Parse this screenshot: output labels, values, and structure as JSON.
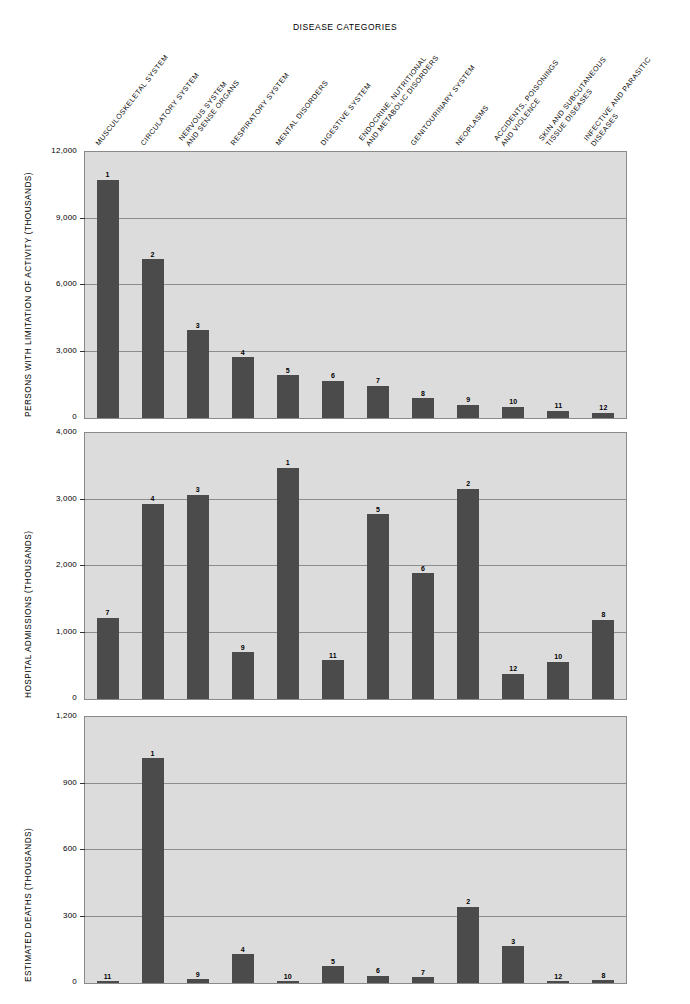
{
  "chart_title": "DISEASE CATEGORIES",
  "categories": [
    {
      "id": 1,
      "lines": [
        "MUSCULOSKELETAL SYSTEM"
      ]
    },
    {
      "id": 2,
      "lines": [
        "CIRCULATORY SYSTEM"
      ]
    },
    {
      "id": 3,
      "lines": [
        "NERVOUS SYSTEM",
        "AND SENSE ORGANS"
      ]
    },
    {
      "id": 4,
      "lines": [
        "RESPIRATORY SYSTEM"
      ]
    },
    {
      "id": 5,
      "lines": [
        "MENTAL DISORDERS"
      ]
    },
    {
      "id": 6,
      "lines": [
        "DIGESTIVE SYSTEM"
      ]
    },
    {
      "id": 7,
      "lines": [
        "ENDOCRINE, NUTRITIONAL",
        "AND METABOLIC DISORDERS"
      ]
    },
    {
      "id": 8,
      "lines": [
        "GENITOURINARY SYSTEM"
      ]
    },
    {
      "id": 9,
      "lines": [
        "NEOPLASMS"
      ]
    },
    {
      "id": 10,
      "lines": [
        "ACCIDENTS, POISONINGS",
        "AND VIOLENCE"
      ]
    },
    {
      "id": 11,
      "lines": [
        "SKIN AND SUBCUTANEOUS",
        "TISSUE DISEASES"
      ]
    },
    {
      "id": 12,
      "lines": [
        "INFECTIVE AND PARASITIC",
        "DISEASES"
      ]
    }
  ],
  "chart_data": [
    {
      "type": "bar",
      "title": "",
      "ylabel": "PERSONS WITH LIMITATION OF ACTIVITY (THOUSANDS)",
      "xlabel": "DISEASE CATEGORIES",
      "ylim": [
        0,
        12000
      ],
      "yticks": [
        0,
        3000,
        6000,
        9000,
        12000
      ],
      "ytick_labels": [
        "0",
        "3,000",
        "6,000",
        "9,000",
        "12,000"
      ],
      "grid": true,
      "legend": "none",
      "categories": [
        "MUSCULOSKELETAL SYSTEM",
        "CIRCULATORY SYSTEM",
        "NERVOUS SYSTEM AND SENSE ORGANS",
        "RESPIRATORY SYSTEM",
        "MENTAL DISORDERS",
        "DIGESTIVE SYSTEM",
        "ENDOCRINE, NUTRITIONAL AND METABOLIC DISORDERS",
        "GENITOURINARY SYSTEM",
        "NEOPLASMS",
        "ACCIDENTS, POISONINGS AND VIOLENCE",
        "SKIN AND SUBCUTANEOUS TISSUE DISEASES",
        "INFECTIVE AND PARASITIC DISEASES"
      ],
      "values": [
        10760,
        7170,
        3970,
        2750,
        1940,
        1670,
        1450,
        900,
        590,
        500,
        320,
        230
      ],
      "rank_labels": [
        "1",
        "2",
        "3",
        "4",
        "5",
        "6",
        "7",
        "8",
        "9",
        "10",
        "11",
        "12"
      ]
    },
    {
      "type": "bar",
      "title": "",
      "ylabel": "HOSPITAL ADMISSIONS (THOUSANDS)",
      "xlabel": "DISEASE CATEGORIES",
      "ylim": [
        0,
        4000
      ],
      "yticks": [
        0,
        1000,
        2000,
        3000,
        4000
      ],
      "ytick_labels": [
        "0",
        "1,000",
        "2,000",
        "3,000",
        "4,000"
      ],
      "grid": true,
      "legend": "none",
      "categories": [
        "MUSCULOSKELETAL SYSTEM",
        "CIRCULATORY SYSTEM",
        "NERVOUS SYSTEM AND SENSE ORGANS",
        "RESPIRATORY SYSTEM",
        "MENTAL DISORDERS",
        "DIGESTIVE SYSTEM",
        "ENDOCRINE, NUTRITIONAL AND METABOLIC DISORDERS",
        "GENITOURINARY SYSTEM",
        "NEOPLASMS",
        "ACCIDENTS, POISONINGS AND VIOLENCE",
        "SKIN AND SUBCUTANEOUS TISSUE DISEASES",
        "INFECTIVE AND PARASITIC DISEASES"
      ],
      "values": [
        1220,
        2940,
        3075,
        700,
        3480,
        580,
        2780,
        1890,
        3165,
        380,
        560,
        1190
      ],
      "rank_labels": [
        "7",
        "4",
        "3",
        "9",
        "1",
        "11",
        "5",
        "6",
        "2",
        "12",
        "10",
        "8"
      ]
    },
    {
      "type": "bar",
      "title": "",
      "ylabel": "ESTIMATED DEATHS (THOUSANDS)",
      "xlabel": "DISEASE CATEGORIES",
      "ylim": [
        0,
        1200
      ],
      "yticks": [
        0,
        300,
        600,
        900,
        1200
      ],
      "ytick_labels": [
        "0",
        "300",
        "600",
        "900",
        "1,200"
      ],
      "grid": true,
      "legend": "none",
      "categories": [
        "MUSCULOSKELETAL SYSTEM",
        "CIRCULATORY SYSTEM",
        "NERVOUS SYSTEM AND SENSE ORGANS",
        "RESPIRATORY SYSTEM",
        "MENTAL DISORDERS",
        "DIGESTIVE SYSTEM",
        "ENDOCRINE, NUTRITIONAL AND METABOLIC DISORDERS",
        "GENITOURINARY SYSTEM",
        "NEOPLASMS",
        "ACCIDENTS, POISONINGS AND VIOLENCE",
        "SKIN AND SUBCUTANEOUS TISSUE DISEASES",
        "INFECTIVE AND PARASITIC DISEASES"
      ],
      "values": [
        6,
        1015,
        16,
        130,
        9,
        75,
        32,
        25,
        345,
        165,
        4,
        13
      ],
      "rank_labels": [
        "11",
        "1",
        "9",
        "4",
        "10",
        "5",
        "6",
        "7",
        "2",
        "3",
        "12",
        "8"
      ]
    }
  ],
  "style": {
    "bar_color": "#4b4b4b",
    "panel_bg": "#dcdcdc",
    "grid_color": "#8d8d8d"
  }
}
